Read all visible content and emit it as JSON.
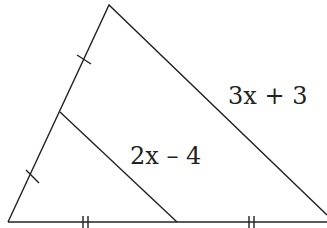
{
  "diagram": {
    "type": "triangle-midsegment",
    "stroke_color": "#222222",
    "vertices": {
      "apex": [
        109,
        5
      ],
      "bottom_left": [
        8,
        222
      ],
      "bottom_right": [
        327,
        222
      ]
    },
    "midsegment": {
      "from": [
        60,
        112
      ],
      "to": [
        177,
        222
      ]
    },
    "labels": {
      "side": "3x + 3",
      "midsegment": "2x – 4"
    },
    "tick_marks": {
      "left_side": "single tick on each half",
      "bottom_side": "double tick on each half"
    }
  }
}
